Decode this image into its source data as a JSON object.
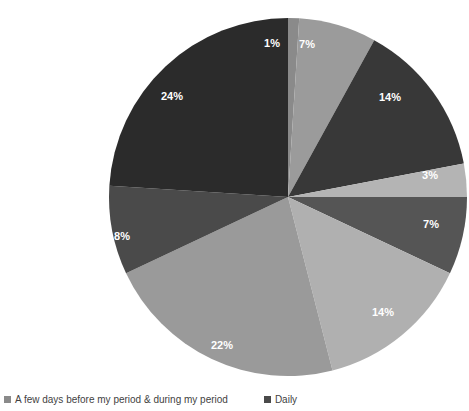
{
  "chart_data": {
    "type": "pie",
    "title": "",
    "legend_position": "bottom",
    "start_angle_deg": 0,
    "direction": "clockwise",
    "center": {
      "x": 288,
      "y": 197
    },
    "radius": 179,
    "labels_shown": "percent",
    "categories": [
      "A few days before my period & during my period",
      "Daily",
      "Slice 3",
      "Slice 4",
      "Slice 5",
      "Slice 6",
      "Slice 7",
      "Slice 8",
      "Slice 9"
    ],
    "values": [
      1,
      7,
      14,
      3,
      7,
      14,
      22,
      8,
      24
    ],
    "value_labels": [
      "1%",
      "7%",
      "14%",
      "3%",
      "7%",
      "14%",
      "22%",
      "8%",
      "24%"
    ],
    "colors": [
      "#8a8a8a",
      "#9b9b9b",
      "#383838",
      "#b4b4b4",
      "#555555",
      "#b0b0b0",
      "#9a9a9a",
      "#4a4a4a",
      "#2b2b2b"
    ],
    "slices": [
      {
        "label": "1%",
        "value": 1,
        "color": "#8a8a8a",
        "start": 0,
        "end": 3.6,
        "label_x": 272,
        "label_y": 44
      },
      {
        "label": "7%",
        "value": 7,
        "color": "#9b9b9b",
        "start": 3.6,
        "end": 28.8,
        "label_x": 307,
        "label_y": 45
      },
      {
        "label": "14%",
        "value": 14,
        "color": "#383838",
        "start": 28.8,
        "end": 79.2,
        "label_x": 390,
        "label_y": 98
      },
      {
        "label": "3%",
        "value": 3,
        "color": "#b4b4b4",
        "start": 79.2,
        "end": 90.0,
        "label_x": 430,
        "label_y": 176
      },
      {
        "label": "7%",
        "value": 7,
        "color": "#555555",
        "start": 90.0,
        "end": 115.2,
        "label_x": 431,
        "label_y": 225
      },
      {
        "label": "14%",
        "value": 14,
        "color": "#b0b0b0",
        "start": 115.2,
        "end": 165.6,
        "label_x": 383,
        "label_y": 313
      },
      {
        "label": "22%",
        "value": 22,
        "color": "#9a9a9a",
        "start": 165.6,
        "end": 244.8,
        "label_x": 222,
        "label_y": 346
      },
      {
        "label": "8%",
        "value": 8,
        "color": "#4a4a4a",
        "start": 244.8,
        "end": 273.6,
        "label_x": 122,
        "label_y": 237
      },
      {
        "label": "24%",
        "value": 24,
        "color": "#2b2b2b",
        "start": 273.6,
        "end": 360.0,
        "label_x": 172,
        "label_y": 97
      }
    ],
    "legend": [
      {
        "label": "A few days before my period & during my period",
        "color": "#8a8a8a"
      },
      {
        "label": "Daily",
        "color": "#4a4a4a"
      }
    ]
  }
}
